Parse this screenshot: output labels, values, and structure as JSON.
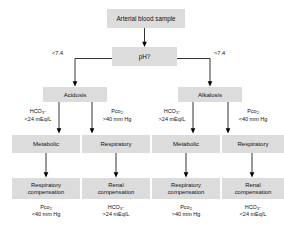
{
  "diagram": {
    "type": "flowchart",
    "colors": {
      "box_fill": "#dcdcdc",
      "text": "#111111",
      "line": "#000000",
      "background": "#ffffff"
    },
    "root": {
      "label": "Arterial blood sample"
    },
    "decision": {
      "label": "pH?"
    },
    "branches": [
      {
        "label": "<7.4",
        "side": "left"
      },
      {
        "label": ">7.4",
        "side": "right"
      }
    ],
    "level2": [
      {
        "label": "Acidosis"
      },
      {
        "label": "Alkalosis"
      }
    ],
    "criteria": [
      {
        "analyte": "HCO",
        "sub": "3",
        "sup": "–",
        "threshold": "<24 mEq/L"
      },
      {
        "analyte": "Pco",
        "sub": "2",
        "sup": "",
        "threshold": ">40 mm Hg"
      },
      {
        "analyte": "HCO",
        "sub": "3",
        "sup": "–",
        "threshold": ">24 mEq/L"
      },
      {
        "analyte": "Pco",
        "sub": "2",
        "sup": "",
        "threshold": "<40 mm Hg"
      }
    ],
    "level3": [
      {
        "label": "Metabolic"
      },
      {
        "label": "Respiratory"
      },
      {
        "label": "Metabolic"
      },
      {
        "label": "Respiratory"
      }
    ],
    "level4": [
      {
        "line1": "Respiratory",
        "line2": "compensation"
      },
      {
        "line1": "Renal",
        "line2": "compensation"
      },
      {
        "line1": "Respiratory",
        "line2": "compensation"
      },
      {
        "line1": "Renal",
        "line2": "compensation"
      }
    ],
    "outcomes": [
      {
        "analyte": "Pco",
        "sub": "2",
        "sup": "",
        "threshold": "<40 mm Hg"
      },
      {
        "analyte": "HCO",
        "sub": "3",
        "sup": "–",
        "threshold": ">24 mEq/L"
      },
      {
        "analyte": "Pco",
        "sub": "2",
        "sup": "",
        "threshold": ">40 mm Hg"
      },
      {
        "analyte": "HCO",
        "sub": "3",
        "sup": "–",
        "threshold": "<24 mEq/L"
      }
    ]
  }
}
